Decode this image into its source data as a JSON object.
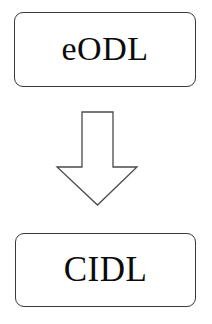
{
  "diagram": {
    "type": "flow-diagram",
    "orientation": "vertical",
    "background_color": "#ffffff",
    "nodes": [
      {
        "id": "source",
        "label": "eODL",
        "shape": "rounded-rectangle",
        "fill_color": "#ffffff",
        "border_color": "#3a3a3a",
        "text_color": "#0b0b0b"
      },
      {
        "id": "target",
        "label": "CIDL",
        "shape": "rounded-rectangle",
        "fill_color": "#ffffff",
        "border_color": "#3a3a3a",
        "text_color": "#0b0b0b"
      }
    ],
    "connector": {
      "id": "transform-arrow",
      "kind": "block-arrow",
      "direction": "down",
      "label": "",
      "fill_color": "#ffffff",
      "border_color": "#4a4a4a",
      "from": "source",
      "to": "target"
    }
  }
}
